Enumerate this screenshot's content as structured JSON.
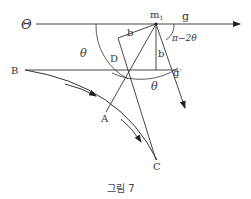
{
  "figure": {
    "caption": "그림 7",
    "labels": {
      "theta_upper": "Θ",
      "g": "g",
      "m1_base": "m",
      "m1_sub": "1",
      "pi_minus": "π−2θ",
      "theta_left": "θ",
      "theta_bottom": "θ",
      "b_top": "b",
      "b_right": "b",
      "D": "D",
      "g_prime": "g′",
      "B": "B",
      "A": "A",
      "C": "C"
    },
    "points": {
      "m1": [
        156,
        24
      ],
      "D_corner": [
        128,
        70
      ],
      "B": [
        25,
        70
      ],
      "A": [
        106,
        112
      ],
      "C": [
        157,
        162
      ]
    },
    "colors": {
      "stroke": "#333333",
      "background": "#ffffff"
    }
  }
}
